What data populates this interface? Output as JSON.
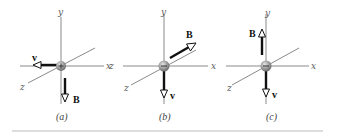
{
  "figure": {
    "panels": [
      {
        "caption": "(a)",
        "axes": {
          "x": "x",
          "y": "y",
          "z": "z"
        },
        "particle_charge_sign": "+",
        "vectors": [
          {
            "label": "v",
            "direction": "-x"
          },
          {
            "label": "B",
            "direction": "-y"
          }
        ]
      },
      {
        "caption": "(b)",
        "axes": {
          "x": "x",
          "y": "y",
          "z": "z"
        },
        "particle_charge_sign": "-",
        "vectors": [
          {
            "label": "B",
            "direction": "-z"
          },
          {
            "label": "v",
            "direction": "-y"
          }
        ]
      },
      {
        "caption": "(c)",
        "axes": {
          "x": "x",
          "y": "y",
          "z": "z"
        },
        "particle_charge_sign": "-",
        "vectors": [
          {
            "label": "B",
            "direction": "+y"
          },
          {
            "label": "v",
            "direction": "-y"
          }
        ]
      }
    ]
  },
  "colors": {
    "axis": "#8a8a8a",
    "vector": "#111111",
    "particle": "#9a9a9a",
    "rule": "#bbbbbb"
  }
}
